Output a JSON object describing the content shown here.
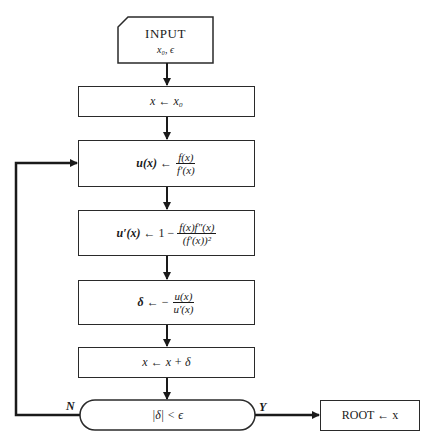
{
  "diagram": {
    "type": "flowchart",
    "nodes": {
      "input": {
        "title": "INPUT",
        "params": "x₀, ϵ"
      },
      "init": {
        "lhs": "x",
        "arrow": "←",
        "rhs": "x₀"
      },
      "u": {
        "lhs": "u(x)",
        "arrow": "←",
        "num": "f(x)",
        "den": "f′(x)"
      },
      "uprime": {
        "lhs": "u′(x)",
        "arrow": "←",
        "prefix": "1 −",
        "num": "f(x)f″(x)",
        "den": "(f′(x))²"
      },
      "delta": {
        "lhs": "δ",
        "arrow": "← −",
        "num": "u(x)",
        "den": "u′(x)"
      },
      "update": {
        "text": "x ← x + δ"
      },
      "decision": {
        "text": "|δ| < ϵ"
      },
      "root": {
        "text": "ROOT ← x"
      }
    },
    "edge_labels": {
      "no": "N",
      "yes": "Y"
    },
    "colors": {
      "line": "#1a1a1a",
      "border": "#2a2a2a",
      "background": "#ffffff"
    }
  }
}
